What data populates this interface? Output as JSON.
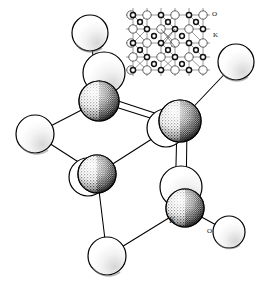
{
  "figure": {
    "kind": "crystal-structure-ball-and-stick-drawing",
    "style": "black-and-white line art with stippled shading",
    "background_color": "#ffffff",
    "line_color": "#000000",
    "atom_types": [
      {
        "symbol": "O",
        "name": "oxygen",
        "render": "large open white sphere",
        "fill": "#ffffff",
        "stroke": "#000000"
      },
      {
        "symbol": "K",
        "name": "potassium",
        "render": "stippled shaded sphere",
        "fill": "#ffffff",
        "stipple": "#1a1a1a",
        "stroke": "#000000"
      }
    ],
    "labels": {
      "main_k": "K",
      "main_o": "O",
      "inset_o": "O",
      "inset_k": "K"
    }
  },
  "main_model": {
    "name": "main ball-and-stick fragment",
    "atoms": [
      {
        "id": "o-top-left",
        "symbol": "O",
        "cx": 90,
        "cy": 33,
        "r": 18
      },
      {
        "id": "o-upper-left",
        "symbol": "O",
        "cx": 104,
        "cy": 73,
        "r": 21
      },
      {
        "id": "k-upper-left",
        "symbol": "K",
        "cx": 99,
        "cy": 101,
        "r": 20
      },
      {
        "id": "o-left",
        "symbol": "O",
        "cx": 35,
        "cy": 134,
        "r": 19
      },
      {
        "id": "o-center-left",
        "symbol": "O",
        "cx": 88,
        "cy": 177,
        "r": 19
      },
      {
        "id": "k-center-left",
        "symbol": "K",
        "cx": 97,
        "cy": 174,
        "r": 19
      },
      {
        "id": "o-center",
        "symbol": "O",
        "cx": 166,
        "cy": 128,
        "r": 19
      },
      {
        "id": "k-center",
        "symbol": "K",
        "cx": 180,
        "cy": 121,
        "r": 21
      },
      {
        "id": "o-right",
        "symbol": "O",
        "cx": 236,
        "cy": 62,
        "r": 18
      },
      {
        "id": "o-lower-right",
        "symbol": "O",
        "cx": 181,
        "cy": 187,
        "r": 21
      },
      {
        "id": "k-lower-right",
        "symbol": "K",
        "cx": 185,
        "cy": 208,
        "r": 19
      },
      {
        "id": "o-bottom",
        "symbol": "O",
        "cx": 107,
        "cy": 256,
        "r": 19
      },
      {
        "id": "o-bottom-right",
        "symbol": "O",
        "cx": 229,
        "cy": 232,
        "r": 16
      }
    ],
    "bonds": [
      {
        "from": "o-top-left",
        "to": "k-upper-left",
        "type": "single"
      },
      {
        "from": "k-upper-left",
        "to": "o-left",
        "type": "single"
      },
      {
        "from": "k-upper-left",
        "to": "k-center",
        "type": "double"
      },
      {
        "from": "o-left",
        "to": "k-center-left",
        "type": "single"
      },
      {
        "from": "k-center-left",
        "to": "k-center",
        "type": "single"
      },
      {
        "from": "k-center",
        "to": "o-right",
        "type": "single"
      },
      {
        "from": "k-center",
        "to": "k-lower-right",
        "type": "double"
      },
      {
        "from": "k-center-left",
        "to": "o-bottom",
        "type": "single"
      },
      {
        "from": "o-bottom",
        "to": "k-lower-right",
        "type": "single"
      },
      {
        "from": "k-lower-right",
        "to": "o-bottom-right",
        "type": "single"
      }
    ],
    "label_positions": [
      {
        "text": "K",
        "x": 172,
        "y": 222,
        "for": "k-lower-right"
      },
      {
        "text": "O",
        "x": 210,
        "y": 233,
        "for": "o-bottom-right"
      }
    ]
  },
  "inset": {
    "name": "extended lattice inset",
    "x": 126,
    "y": 8,
    "width": 84,
    "height": 68,
    "description": "extended crystal lattice showing alternating large open O spheres and small dark-ringed K spheres joined by thin bond lines",
    "labels": [
      {
        "text": "O",
        "x": 212,
        "y": 15
      },
      {
        "text": "K",
        "x": 213,
        "y": 36
      }
    ],
    "grid": {
      "large_circle_radius": 4.2,
      "small_circle_radius": 2.9,
      "large_fill": "#ffffff",
      "small_fill": "#4a4a4a",
      "stroke": "#2b2b2b"
    }
  }
}
